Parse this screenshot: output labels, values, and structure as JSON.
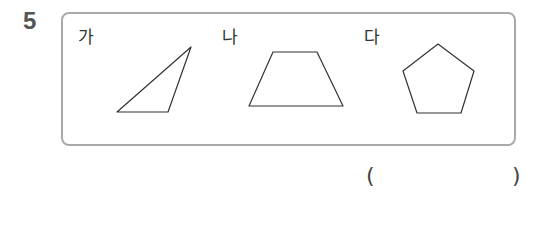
{
  "question": {
    "number": "5"
  },
  "figures": [
    {
      "label": "가",
      "shape": "triangle",
      "points": "191,47 168,112 117,112"
    },
    {
      "label": "나",
      "shape": "trapezoid",
      "points": "273,52 317,52 343,106 249,106"
    },
    {
      "label": "다",
      "shape": "pentagon",
      "points": "438,44 474,71 461,113 417,113 403,71"
    }
  ],
  "answer": {
    "open_paren": "(",
    "close_paren": ")",
    "value": ""
  },
  "colors": {
    "box_border": "#a9a9a9",
    "stroke": "#333333"
  }
}
